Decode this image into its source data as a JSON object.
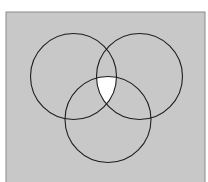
{
  "diagram": {
    "type": "venn",
    "sets": 3,
    "colors": {
      "page_background": "#ffffff",
      "panel_fill": "#c8c8c8",
      "panel_border": "#8a8a8a",
      "circle_stroke": "#1e1e1e",
      "highlight_fill": "#ffffff"
    },
    "panel": {
      "x": 6,
      "y": 12,
      "width": 199,
      "height": 172
    },
    "circles": [
      {
        "name": "left",
        "cx": 73.5,
        "cy": 76.5,
        "r": 43
      },
      {
        "name": "right",
        "cx": 139.5,
        "cy": 76.5,
        "r": 43
      },
      {
        "name": "bottom",
        "cx": 108,
        "cy": 119.5,
        "r": 43
      }
    ],
    "highlighted_region": "intersection of all three circles"
  }
}
